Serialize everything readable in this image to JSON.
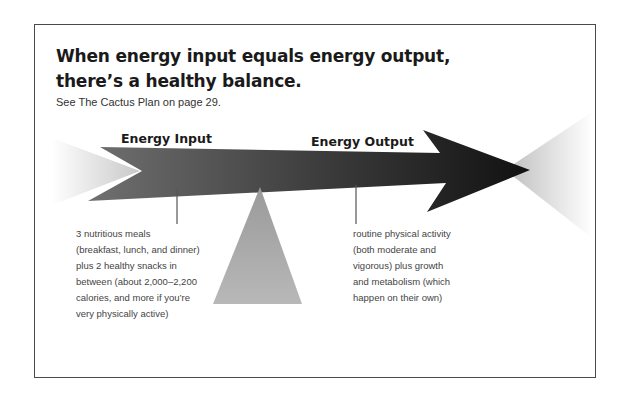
{
  "heading": {
    "line1": "When energy input equals energy output,",
    "line2": "there’s a healthy balance."
  },
  "subtitle": "See The Cactus Plan on page 29.",
  "diagram": {
    "input": {
      "label": "Energy Input",
      "description": [
        "3 nutritious meals",
        "(breakfast, lunch, and dinner)",
        "plus 2 healthy snacks in",
        "between (about 2,000–2,200",
        "calories, and more if you’re",
        "very physically active)"
      ]
    },
    "output": {
      "label": "Energy Output",
      "description": [
        "routine physical activity",
        "(both moderate and",
        "vigorous) plus growth",
        "and metabolism (which",
        "happen on their own)"
      ]
    },
    "colors": {
      "arrow_start": "#6e6e6e",
      "arrow_end": "#111111",
      "fulcrum": "#a6a6a6",
      "frame": "#4a4a4a"
    }
  }
}
